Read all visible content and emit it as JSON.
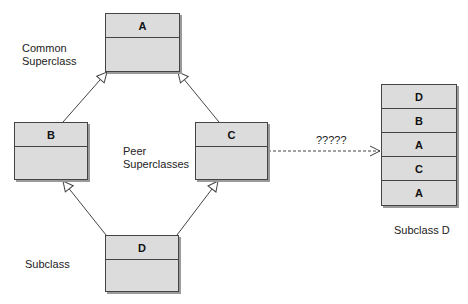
{
  "classes": {
    "a": {
      "name": "A"
    },
    "b": {
      "name": "B"
    },
    "c": {
      "name": "C"
    },
    "d": {
      "name": "D"
    }
  },
  "labels": {
    "common_superclass": "Common\nSuperclass",
    "peer_superclasses": "Peer\nSuperclasses",
    "subclass": "Subclass",
    "subclass_d": "Subclass D",
    "question": "?????"
  },
  "stack": {
    "rows": [
      "D",
      "B",
      "A",
      "C",
      "A"
    ]
  },
  "colors": {
    "box_fill": "#dcdcdc",
    "border": "#444444"
  }
}
